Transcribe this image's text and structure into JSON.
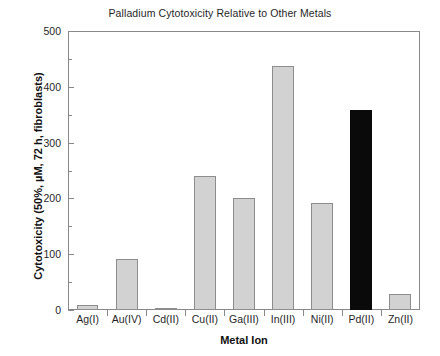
{
  "chart_data": {
    "type": "bar",
    "title": "Palladium Cytotoxicity Relative to Other Metals",
    "xlabel": "Metal Ion",
    "ylabel": "Cytotoxicity (50%, µM, 72 h, fibroblasts)",
    "categories": [
      "Ag(I)",
      "Au(IV)",
      "Cd(II)",
      "Cu(II)",
      "Ga(III)",
      "In(III)",
      "Ni(II)",
      "Pd(II)",
      "Zn(II)"
    ],
    "values": [
      9,
      92,
      3,
      240,
      200,
      437,
      191,
      359,
      29
    ],
    "highlight_category": "Pd(II)",
    "ylim": [
      0,
      500
    ],
    "yticks": [
      0,
      100,
      200,
      300,
      400,
      500
    ],
    "ytick_labels": [
      "0",
      "100",
      "200",
      "300",
      "400",
      "500"
    ],
    "yminor_ticks": [
      50,
      150,
      250,
      350,
      450
    ],
    "grid": false,
    "legend": "none",
    "bar_color": "#d2d2d2",
    "bar_edge_color": "#8d8d8d",
    "highlight_color": "#0a0a0a",
    "axis_color": "#888888"
  }
}
